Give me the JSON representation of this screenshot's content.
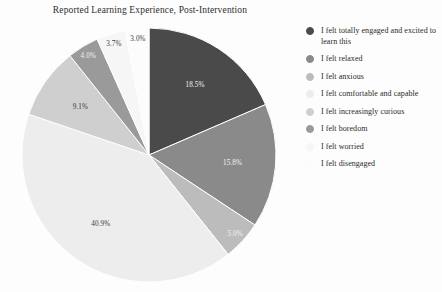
{
  "chart_data": {
    "type": "pie",
    "title": "Reported Learning Experience, Post-Intervention",
    "categories": [
      "I felt totally engaged and excited to learn this",
      "I felt relaxed",
      "I felt anxious",
      "I felt comfortable and capable",
      "I felt increasingly curious",
      "I felt boredom",
      "I felt worried",
      "I felt disengaged"
    ],
    "values": [
      18.5,
      15.8,
      5.0,
      40.9,
      9.1,
      4.0,
      3.7,
      3.0
    ],
    "value_labels": [
      "18.5%",
      "15.8%",
      "5.0%",
      "40.9%",
      "9.1%",
      "4.0%",
      "3.7%",
      "3.0%"
    ],
    "colors": [
      "#4a4a4a",
      "#8a8a8a",
      "#bcbcbc",
      "#ededed",
      "#cfcfcf",
      "#9a9a9a",
      "#f6f6f6",
      "#fcfcfc"
    ],
    "label_text_colors": [
      "#f2f2f2",
      "#f2f2f2",
      "#f2f2f2",
      "#3a3a3a",
      "#3a3a3a",
      "#f2f2f2",
      "#3a3a3a",
      "#3a3a3a"
    ],
    "startangle": 90,
    "counterclock": false,
    "legend_position": "right",
    "grid": false,
    "xlabel": "",
    "ylabel": ""
  },
  "legend": {
    "items": [
      {
        "label": "I felt totally engaged and excited to learn this",
        "color": "#4a4a4a"
      },
      {
        "label": "I felt relaxed",
        "color": "#8a8a8a"
      },
      {
        "label": "I felt anxious",
        "color": "#bcbcbc"
      },
      {
        "label": "I felt comfortable and capable",
        "color": "#ededed"
      },
      {
        "label": "I felt increasingly curious",
        "color": "#cfcfcf"
      },
      {
        "label": "I felt boredom",
        "color": "#9a9a9a"
      },
      {
        "label": "I felt worried",
        "color": "#f6f6f6"
      },
      {
        "label": "I felt disengaged",
        "color": "#fcfcfc"
      }
    ]
  }
}
